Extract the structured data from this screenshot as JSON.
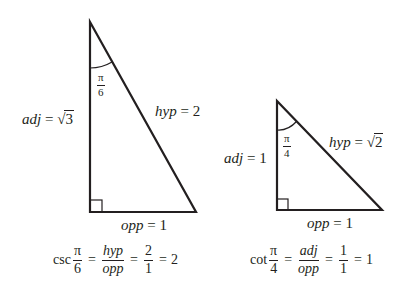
{
  "diagrams": [
    {
      "name": "triangle-pi-over-6",
      "angle_label": {
        "num": "π",
        "den": "6"
      },
      "adj_label": {
        "var": "adj",
        "eq": "=",
        "sqrt_sym": "√",
        "value": "3"
      },
      "hyp_label": {
        "var": "hyp",
        "eq": "=",
        "value": "2"
      },
      "opp_label": {
        "var": "opp",
        "eq": "=",
        "value": "1"
      },
      "formula": {
        "func": "csc",
        "angle": {
          "num": "π",
          "den": "6"
        },
        "eq1": "=",
        "ratio": {
          "num": "hyp",
          "den": "opp"
        },
        "eq2": "=",
        "values": {
          "num": "2",
          "den": "1"
        },
        "eq3": "=",
        "result": "2"
      }
    },
    {
      "name": "triangle-pi-over-4",
      "angle_label": {
        "num": "π",
        "den": "4"
      },
      "adj_label": {
        "var": "adj",
        "eq": "=",
        "value": "1"
      },
      "hyp_label": {
        "var": "hyp",
        "eq": "=",
        "sqrt_sym": "√",
        "value": "2"
      },
      "opp_label": {
        "var": "opp",
        "eq": "=",
        "value": "1"
      },
      "formula": {
        "func": "cot",
        "angle": {
          "num": "π",
          "den": "4"
        },
        "eq1": "=",
        "ratio": {
          "num": "adj",
          "den": "opp"
        },
        "eq2": "=",
        "values": {
          "num": "1",
          "den": "1"
        },
        "eq3": "=",
        "result": "1"
      }
    }
  ],
  "colors": {
    "stroke": "#231f20",
    "background": "#ffffff"
  }
}
